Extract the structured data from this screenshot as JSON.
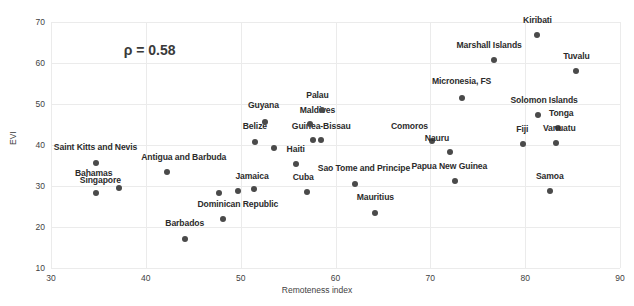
{
  "chart_data": {
    "type": "scatter",
    "title": "",
    "xlabel": "Remoteness index",
    "ylabel": "EVI",
    "xlim": [
      30,
      90
    ],
    "ylim": [
      10,
      70
    ],
    "xticks": [
      30,
      40,
      50,
      60,
      70,
      80,
      90
    ],
    "yticks": [
      10,
      20,
      30,
      40,
      50,
      60,
      70
    ],
    "grid": true,
    "legend": "none",
    "annotations": [
      {
        "text": "ρ = 0.58",
        "x": 40.4,
        "y": 63.2
      }
    ],
    "marker_color": "#4a4a4a",
    "grid_color": "#ebebeb",
    "points": [
      {
        "label": "Saint Kitts and Nevis",
        "x": 34.7,
        "y": 35.6,
        "label_x": 34.7,
        "label_y": 38.4
      },
      {
        "label": "Bahamas",
        "x": 37.2,
        "y": 29.5,
        "label_x": 34.5,
        "label_y": 32.0
      },
      {
        "label": "Singapore",
        "x": 34.7,
        "y": 28.3,
        "label_x": 35.2,
        "label_y": 30.2
      },
      {
        "label": "Antigua and Barbuda",
        "x": 42.2,
        "y": 33.4,
        "label_x": 44.0,
        "label_y": 35.9
      },
      {
        "label": "Barbados",
        "x": 44.1,
        "y": 17.1,
        "label_x": 44.1,
        "label_y": 19.8
      },
      {
        "label": "Dominican Republic",
        "x": 48.1,
        "y": 22.0,
        "label_x": 49.7,
        "label_y": 24.5
      },
      {
        "label": "",
        "x": 47.7,
        "y": 28.3,
        "label_x": 0,
        "label_y": 0
      },
      {
        "label": "Jamaica",
        "x": 49.7,
        "y": 28.8,
        "label_x": 51.2,
        "label_y": 31.3
      },
      {
        "label": "",
        "x": 51.4,
        "y": 29.3,
        "label_x": 0,
        "label_y": 0
      },
      {
        "label": "Belize",
        "x": 51.5,
        "y": 40.7,
        "label_x": 51.5,
        "label_y": 43.3
      },
      {
        "label": "Guyana",
        "x": 52.6,
        "y": 45.6,
        "label_x": 52.4,
        "label_y": 48.5
      },
      {
        "label": "",
        "x": 53.5,
        "y": 39.3,
        "label_x": 0,
        "label_y": 0
      },
      {
        "label": "Haiti",
        "x": 55.8,
        "y": 35.4,
        "label_x": 55.8,
        "label_y": 37.9
      },
      {
        "label": "Cuba",
        "x": 57.0,
        "y": 28.5,
        "label_x": 56.6,
        "label_y": 31.0
      },
      {
        "label": "Guinea-Bissau",
        "x": 57.6,
        "y": 41.2,
        "label_x": 58.5,
        "label_y": 43.5
      },
      {
        "label": "",
        "x": 58.5,
        "y": 41.2,
        "label_x": 0,
        "label_y": 0
      },
      {
        "label": "Maldives",
        "x": 57.3,
        "y": 45.1,
        "label_x": 58.1,
        "label_y": 47.3
      },
      {
        "label": "Palau",
        "x": 58.6,
        "y": 48.6,
        "label_x": 58.1,
        "label_y": 51.0
      },
      {
        "label": "Sao Tome and Principe",
        "x": 62.1,
        "y": 30.6,
        "label_x": 63.0,
        "label_y": 33.1
      },
      {
        "label": "Mauritius",
        "x": 64.2,
        "y": 23.5,
        "label_x": 64.2,
        "label_y": 26.2
      },
      {
        "label": "Comoros",
        "x": 70.2,
        "y": 40.9,
        "label_x": 67.8,
        "label_y": 43.4
      },
      {
        "label": "Nauru",
        "x": 72.1,
        "y": 38.2,
        "label_x": 70.7,
        "label_y": 40.6
      },
      {
        "label": "Papua New Guinea",
        "x": 72.6,
        "y": 31.2,
        "label_x": 72.0,
        "label_y": 33.7
      },
      {
        "label": "Micronesia, FS",
        "x": 73.3,
        "y": 51.5,
        "label_x": 73.3,
        "label_y": 54.3
      },
      {
        "label": "Marshall Islands",
        "x": 76.7,
        "y": 60.7,
        "label_x": 76.2,
        "label_y": 63.2
      },
      {
        "label": "Kiribati",
        "x": 81.3,
        "y": 66.8,
        "label_x": 81.3,
        "label_y": 69.3
      },
      {
        "label": "Tuvalu",
        "x": 85.4,
        "y": 58.0,
        "label_x": 85.4,
        "label_y": 60.5
      },
      {
        "label": "Solomon Islands",
        "x": 81.4,
        "y": 47.3,
        "label_x": 82.0,
        "label_y": 49.8
      },
      {
        "label": "Tonga",
        "x": 83.5,
        "y": 44.1,
        "label_x": 83.8,
        "label_y": 46.6
      },
      {
        "label": "Vanuatu",
        "x": 83.3,
        "y": 40.5,
        "label_x": 83.6,
        "label_y": 43.0
      },
      {
        "label": "Fiji",
        "x": 79.8,
        "y": 40.2,
        "label_x": 79.7,
        "label_y": 42.7
      },
      {
        "label": "Samoa",
        "x": 82.6,
        "y": 28.8,
        "label_x": 82.6,
        "label_y": 31.3
      }
    ]
  }
}
